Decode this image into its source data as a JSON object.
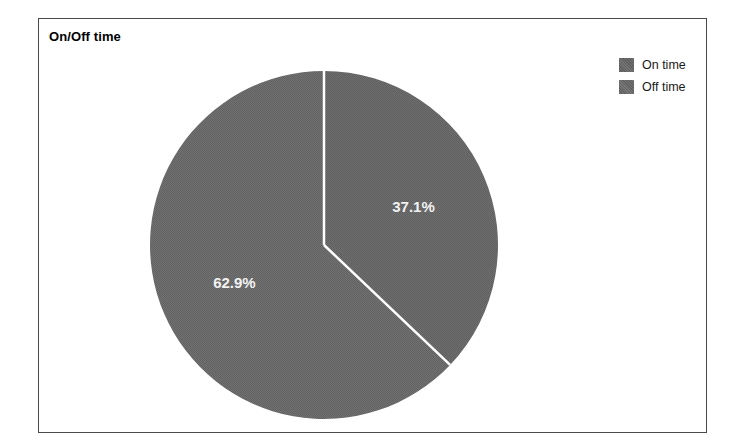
{
  "chart_title": "On/Off time",
  "legend": {
    "position": "top-right",
    "items": [
      {
        "label": "On time",
        "swatch_color": "#6b6b6b",
        "swatch_name": "legend-swatch-on-time"
      },
      {
        "label": "Off time",
        "swatch_color": "#6e6e6e",
        "swatch_name": "legend-swatch-off-time"
      }
    ]
  },
  "labels": {
    "on_time_pct": "37.1%",
    "off_time_pct": "62.9%"
  },
  "colors": {
    "frame_border": "#4a4a4a",
    "background": "#ffffff",
    "slice_on_time": "#6b6b6b",
    "slice_off_time": "#6e6e6e",
    "separator_line": "#ffffff",
    "label_text": "#f2f2f2",
    "title_text": "#000000"
  },
  "chart_data": {
    "type": "pie",
    "title": "On/Off time",
    "xlabel": "",
    "ylabel": "",
    "start_angle_deg": 0,
    "direction": "clockwise",
    "grid": false,
    "legend_position": "top-right",
    "categories": [
      "On time",
      "Off time"
    ],
    "values": [
      37.1,
      62.9
    ],
    "value_unit": "percent",
    "data_labels": [
      "37.1%",
      "62.9%"
    ],
    "slices": [
      {
        "name": "On time",
        "value": 37.1,
        "label": "37.1%",
        "color": "#6b6b6b",
        "start_angle_deg": 0,
        "end_angle_deg": 133.56
      },
      {
        "name": "Off time",
        "value": 62.9,
        "label": "62.9%",
        "color": "#6e6e6e",
        "start_angle_deg": 133.56,
        "end_angle_deg": 360
      }
    ]
  }
}
